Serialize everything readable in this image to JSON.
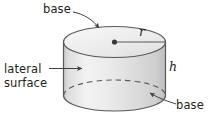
{
  "figure": {
    "shape": "cylinder",
    "labels": {
      "base_top": "base",
      "lateral_surface": "lateral\nsurface",
      "lateral_surface_line1": "lateral",
      "lateral_surface_line2": "surface",
      "base_bottom": "base",
      "radius": "r",
      "height": "h"
    },
    "colors": {
      "outline": "#58595b",
      "body_light": "#f4f4f4",
      "body_mid": "#dcdcdc",
      "body_shadow": "#c9c9c9",
      "top_face": "#ededed",
      "text": "#231f20",
      "leader": "#414042",
      "background": "#ffffff"
    },
    "annotations": [
      {
        "name": "base-top-leader",
        "style": "curved-arrow",
        "from": "base label",
        "to": "top face"
      },
      {
        "name": "lateral-surface-leader",
        "style": "straight-arrow",
        "from": "lateral surface label",
        "to": "side wall"
      },
      {
        "name": "base-bottom-leader",
        "style": "curved-arrow",
        "from": "base label",
        "to": "bottom face"
      },
      {
        "name": "radius-segment",
        "style": "line-with-dot",
        "from": "center of top face",
        "to": "top face edge"
      },
      {
        "name": "height-indicator",
        "style": "vertical-extent",
        "from": "top edge",
        "to": "bottom edge"
      },
      {
        "name": "hidden-base-edge",
        "style": "dashed-ellipse-arc"
      }
    ]
  }
}
